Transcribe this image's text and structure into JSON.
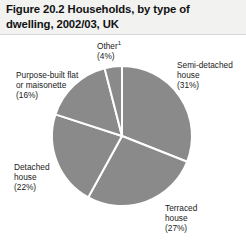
{
  "figure": {
    "title": "Figure 20.2  Households, by type of dwelling, 2002/03, UK"
  },
  "labels": {
    "other": {
      "name": "Other",
      "footnote": "1",
      "percent": "(4%)"
    },
    "semi_detached": {
      "line1": "Semi-detached",
      "line2": "house",
      "percent": "(31%)"
    },
    "purpose_built_flat": {
      "line1": "Purpose-built flat",
      "line2": "or maisonette",
      "percent": "(16%)"
    },
    "detached": {
      "line1": "Detached",
      "line2": "house",
      "percent": "(22%)"
    },
    "terraced": {
      "line1": "Terraced",
      "line2": "house",
      "percent": "(27%)"
    }
  },
  "colors": {
    "slice_fill": "#8a8a8a",
    "slice_separator": "#ffffff",
    "title_band": "#f2f2f1",
    "text": "#1a1a1a",
    "page_background": "#ffffff"
  },
  "chart_data": {
    "type": "pie",
    "title": "Figure 20.2  Households, by type of dwelling, 2002/03, UK",
    "xlabel": "",
    "ylabel": "",
    "legend_position": "none",
    "grid": false,
    "start_angle_deg": 0,
    "direction": "clockwise",
    "center": {
      "x": 122,
      "y": 136
    },
    "radius": 70,
    "categories": [
      "Semi-detached house",
      "Terraced house",
      "Detached house",
      "Purpose-built flat or maisonette",
      "Other"
    ],
    "values": [
      31,
      27,
      22,
      16,
      4
    ],
    "value_labels": [
      "(31%)",
      "(27%)",
      "(22%)",
      "(16%)",
      "(4%)"
    ],
    "units": "percent",
    "total": 100,
    "slice_color": "#8a8a8a",
    "separator_color": "#ffffff",
    "annotations": [
      "Other has footnote marker 1"
    ]
  }
}
